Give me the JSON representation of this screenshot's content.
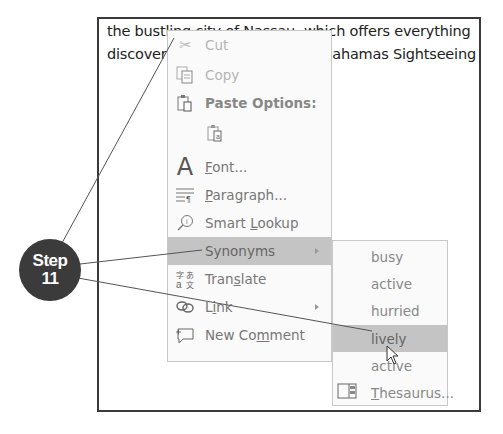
{
  "document": {
    "line1": "the bustling city of Nassau, which offers everything",
    "line2": "discover                                        Bahamas Sightseeing"
  },
  "context_menu": {
    "items": [
      {
        "label": "Cut",
        "icon": "scissors-icon",
        "disabled": true
      },
      {
        "label": "Copy",
        "icon": "copy-icon",
        "disabled": true
      },
      {
        "label": "Paste Options:",
        "icon": "paste-icon",
        "header": true
      },
      {
        "label": "",
        "icon": "paste-keep-text-icon"
      },
      {
        "label": "Font...",
        "icon": "font-icon"
      },
      {
        "label": "Paragraph...",
        "icon": "paragraph-icon"
      },
      {
        "label": "Smart Lookup",
        "icon": "smart-lookup-icon"
      },
      {
        "label": "Synonyms",
        "icon": "",
        "submenu": true,
        "highlighted": true
      },
      {
        "label": "Translate",
        "icon": "translate-icon"
      },
      {
        "label": "Link",
        "icon": "link-icon",
        "submenu": true
      },
      {
        "label": "New Comment",
        "icon": "new-comment-icon"
      }
    ]
  },
  "synonyms_submenu": {
    "items": [
      {
        "label": "busy"
      },
      {
        "label": "active"
      },
      {
        "label": "hurried"
      },
      {
        "label": "lively",
        "highlighted": true
      },
      {
        "label": "active"
      },
      {
        "label": "Thesaurus...",
        "icon": "thesaurus-icon"
      }
    ]
  },
  "callout": {
    "line1": "Step",
    "line2": "11",
    "color": "#3b3b3b"
  },
  "colors": {
    "highlight": "#c4c4c4",
    "menu_bg": "#fafafa",
    "frame_border": "#3a3a3a"
  }
}
